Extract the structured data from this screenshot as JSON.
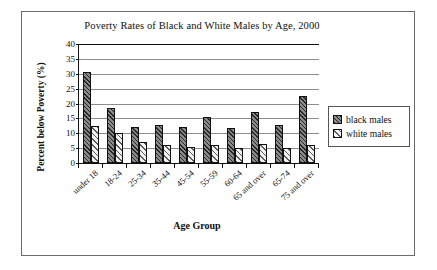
{
  "chart_data": {
    "type": "bar",
    "title": "Poverty Rates of Black and White Males by Age, 2000",
    "xlabel": "Age Group",
    "ylabel": "Percent below Poverty (%)",
    "ylim": [
      0,
      40
    ],
    "yticks": [
      0,
      5,
      10,
      15,
      20,
      25,
      30,
      35,
      40
    ],
    "grid": true,
    "legend_position": "right",
    "categories": [
      "under 18",
      "18-24",
      "25-34",
      "35-44",
      "45-54",
      "55-59",
      "60-64",
      "65 and over",
      "65-74",
      "75 and over"
    ],
    "series": [
      {
        "name": "black males",
        "values": [
          30.5,
          18.5,
          12.0,
          12.7,
          12.0,
          15.3,
          11.9,
          17.1,
          12.8,
          22.4
        ]
      },
      {
        "name": "white males",
        "values": [
          12.6,
          10.2,
          7.0,
          6.0,
          5.3,
          6.2,
          5.0,
          6.3,
          5.2,
          6.1
        ]
      }
    ]
  },
  "legend": {
    "items": [
      {
        "label": "black males"
      },
      {
        "label": "white males"
      }
    ]
  }
}
